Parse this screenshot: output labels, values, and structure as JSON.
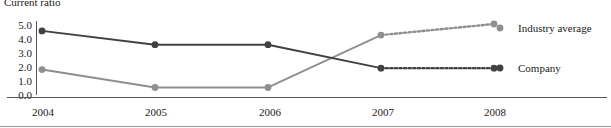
{
  "chart_data": {
    "type": "line",
    "title": "Current ratio",
    "xlabel": "",
    "ylabel": "",
    "categories": [
      "2004",
      "2005",
      "2006",
      "2007",
      "2008"
    ],
    "x": [
      2004,
      2005,
      2006,
      2007,
      2008
    ],
    "ylim": [
      0.0,
      5.0
    ],
    "ytick_labels": [
      "5.0",
      "4.0",
      "3.0",
      "2.0",
      "1.0",
      "0.0"
    ],
    "ytick_values": [
      5.0,
      4.0,
      3.0,
      2.0,
      1.0,
      0.0
    ],
    "grid": false,
    "legend_position": "right",
    "series": [
      {
        "name": "Industry average",
        "values": [
          1.7,
          0.4,
          0.4,
          4.2,
          5.0
        ],
        "color": "#8f8f8f",
        "marker": "circle",
        "dashed_from_index": 3
      },
      {
        "name": "Company",
        "values": [
          4.5,
          3.5,
          3.5,
          1.8,
          1.8
        ],
        "color": "#414141",
        "marker": "circle",
        "dashed_from_index": 3
      }
    ],
    "annotations": []
  },
  "legend": {
    "industry_average": "Industry average",
    "company": "Company"
  },
  "colors": {
    "company_line": "#414141",
    "industry_line": "#8f8f8f",
    "axis": "#555555",
    "text": "#1a1a1a"
  }
}
